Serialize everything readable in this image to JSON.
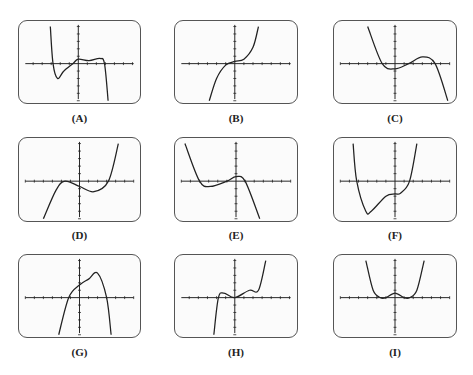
{
  "figure": {
    "axis_color": "#222222",
    "curve_color": "#222222",
    "screen_border_color": "#555555",
    "panels": [
      {
        "id": "A",
        "label": "(A)"
      },
      {
        "id": "B",
        "label": "(B)"
      },
      {
        "id": "C",
        "label": "(C)"
      },
      {
        "id": "D",
        "label": "(D)"
      },
      {
        "id": "E",
        "label": "(E)"
      },
      {
        "id": "F",
        "label": "(F)"
      },
      {
        "id": "G",
        "label": "(G)"
      },
      {
        "id": "H",
        "label": "(H)"
      },
      {
        "id": "I",
        "label": "(I)"
      }
    ]
  },
  "chart_data": [
    {
      "type": "line",
      "title": "(A)",
      "x_ticks_each_side": 5,
      "y_ticks_each_side": 5,
      "shape": "degree-5 style, negative leading coefficient; falls from top-left, local min below axis left of origin, two small bumps above axis right of origin, then drops steeply",
      "points": [
        [
          -3.1,
          5
        ],
        [
          -2.8,
          0
        ],
        [
          -2.3,
          -2
        ],
        [
          -1.6,
          -1
        ],
        [
          -0.6,
          0
        ],
        [
          0,
          0.6
        ],
        [
          1.2,
          0.4
        ],
        [
          2.4,
          0.7
        ],
        [
          2.9,
          0
        ],
        [
          3.3,
          -5
        ]
      ]
    },
    {
      "type": "line",
      "title": "(B)",
      "x_ticks_each_side": 6,
      "y_ticks_each_side": 5,
      "shape": "cubic, positive leading coefficient, inflection slightly above origin",
      "points": [
        [
          -2.8,
          -5
        ],
        [
          -2,
          -2
        ],
        [
          -1,
          -0.2
        ],
        [
          0,
          0.3
        ],
        [
          1,
          0.6
        ],
        [
          2,
          2.2
        ],
        [
          2.6,
          5
        ]
      ]
    },
    {
      "type": "line",
      "title": "(C)",
      "x_ticks_each_side": 6,
      "y_ticks_each_side": 5,
      "shape": "cubic, negative leading coefficient; local min just below axis near origin, local max right of origin",
      "points": [
        [
          -3,
          5
        ],
        [
          -1.4,
          0
        ],
        [
          0,
          -0.7
        ],
        [
          1.5,
          0
        ],
        [
          3,
          0.9
        ],
        [
          4.4,
          0
        ],
        [
          5.8,
          -5
        ]
      ]
    },
    {
      "type": "line",
      "title": "(D)",
      "x_ticks_each_side": 6,
      "y_ticks_each_side": 5,
      "shape": "cubic, positive leading coefficient; local max touching axis left of origin, local min below axis right of origin",
      "points": [
        [
          -4,
          -5
        ],
        [
          -2.6,
          -1.2
        ],
        [
          -1.6,
          0
        ],
        [
          0,
          -0.7
        ],
        [
          1.6,
          -1.4
        ],
        [
          3.2,
          0
        ],
        [
          4.3,
          5
        ]
      ]
    },
    {
      "type": "line",
      "title": "(E)",
      "x_ticks_each_side": 6,
      "y_ticks_each_side": 5,
      "shape": "cubic, negative leading coefficient; local min below axis left of origin, local max just above axis at origin",
      "points": [
        [
          -5.6,
          5
        ],
        [
          -4,
          0
        ],
        [
          -2.8,
          -0.7
        ],
        [
          -1,
          0
        ],
        [
          0,
          0.6
        ],
        [
          1,
          0
        ],
        [
          2.6,
          -5
        ]
      ]
    },
    {
      "type": "line",
      "title": "(F)",
      "x_ticks_each_side": 6,
      "y_ticks_each_side": 5,
      "shape": "quartic, positive leading coefficient; deep minimum left of origin, flat shelf below axis near origin, rises steeply",
      "points": [
        [
          -4.6,
          5
        ],
        [
          -4.2,
          0
        ],
        [
          -3.2,
          -4
        ],
        [
          -2.6,
          -4
        ],
        [
          -1,
          -2
        ],
        [
          0,
          -1.7
        ],
        [
          0.6,
          -1.6
        ],
        [
          1.6,
          0
        ],
        [
          2.4,
          5
        ]
      ]
    },
    {
      "type": "line",
      "title": "(G)",
      "x_ticks_each_side": 6,
      "y_ticks_each_side": 5,
      "shape": "quartic, negative leading coefficient; rises from bottom-left, crosses axis left of origin, maximum above axis right of origin, drops steeply",
      "points": [
        [
          -2.3,
          -5
        ],
        [
          -1.2,
          0
        ],
        [
          0,
          1.7
        ],
        [
          1,
          2.5
        ],
        [
          2,
          3.3
        ],
        [
          3,
          0
        ],
        [
          3.5,
          -5
        ]
      ]
    },
    {
      "type": "line",
      "title": "(H)",
      "x_ticks_each_side": 6,
      "y_ticks_each_side": 5,
      "shape": "quintic-like, positive leading coefficient; steep rise left, small bump above axis left of origin, passes through origin, plateau, then steep rise",
      "points": [
        [
          -2.3,
          -5
        ],
        [
          -1.8,
          0
        ],
        [
          -1.2,
          0.6
        ],
        [
          0,
          0
        ],
        [
          1.6,
          1
        ],
        [
          2.6,
          1
        ],
        [
          3.4,
          5
        ]
      ]
    },
    {
      "type": "line",
      "title": "(I)",
      "x_ticks_each_side": 6,
      "y_ticks_each_side": 5,
      "shape": "even quartic, W-shaped; two minima touching axis symmetric about origin, small local max above axis at origin",
      "points": [
        [
          -3.2,
          5
        ],
        [
          -2.4,
          1
        ],
        [
          -1.6,
          0
        ],
        [
          -1,
          0
        ],
        [
          0,
          0.6
        ],
        [
          1,
          0
        ],
        [
          1.6,
          0
        ],
        [
          2.4,
          1
        ],
        [
          3.2,
          5
        ]
      ]
    }
  ]
}
